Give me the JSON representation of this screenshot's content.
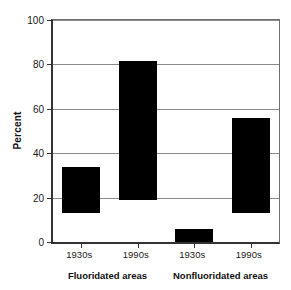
{
  "chart_data": {
    "type": "bar",
    "title": "",
    "subtitle": "",
    "xlabel": "",
    "ylabel": "Percent",
    "ylim": [
      0,
      100
    ],
    "yticks": [
      0,
      20,
      40,
      60,
      80,
      100
    ],
    "ytick_labels": [
      "0",
      "20",
      "40",
      "60",
      "80",
      "100"
    ],
    "grid": true,
    "legend": false,
    "legend_position": "none",
    "note": "Floating bars: each bar spans from a low value to a high value (range bar).",
    "categories": [
      "1930s",
      "1990s",
      "1930s",
      "1990s"
    ],
    "groups": [
      {
        "label": "Fluoridated areas",
        "categories": [
          "1930s",
          "1990s"
        ]
      },
      {
        "label": "Nonfluoridated areas",
        "categories": [
          "1930s",
          "1990s"
        ]
      }
    ],
    "bars": [
      {
        "group": "Fluoridated areas",
        "category": "1930s",
        "low": 13,
        "high": 34,
        "color": "#000000"
      },
      {
        "group": "Fluoridated areas",
        "category": "1990s",
        "low": 19,
        "high": 81.5,
        "color": "#000000"
      },
      {
        "group": "Nonfluoridated areas",
        "category": "1930s",
        "low": 0,
        "high": 6,
        "color": "#000000"
      },
      {
        "group": "Nonfluoridated areas",
        "category": "1990s",
        "low": 13,
        "high": 56,
        "color": "#000000"
      }
    ],
    "values": [
      34,
      81.5,
      6,
      56
    ],
    "low_values": [
      13,
      19,
      0,
      13
    ],
    "colors": {
      "bar_fill": "#000000",
      "axis": "#333333",
      "gridline": "#8a8a8a",
      "background": "#ffffff",
      "text": "#1a1a1a"
    }
  }
}
